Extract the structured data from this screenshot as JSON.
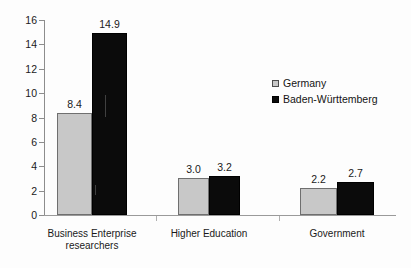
{
  "chart_data": {
    "type": "bar",
    "title": "",
    "subtitle": "",
    "xlabel": "",
    "ylabel": "",
    "categories": [
      "Business Enterprise\nresearchers",
      "Higher Education",
      "Government"
    ],
    "series": [
      {
        "name": "Germany",
        "color": "#c8c8c8",
        "values": [
          8.4,
          3.0,
          2.2
        ],
        "value_labels": [
          "8.4",
          "3.0",
          "2.2"
        ]
      },
      {
        "name": "Baden-Württemberg",
        "color": "#0b0b0b",
        "values": [
          14.9,
          3.2,
          2.7
        ],
        "value_labels": [
          "14.9",
          "3.2",
          "2.7"
        ]
      }
    ],
    "ylim": [
      0,
      16
    ],
    "ytick_step": 2,
    "ytick_labels": [
      "0",
      "2",
      "4",
      "6",
      "8",
      "10",
      "12",
      "14",
      "16"
    ],
    "ytick_values": [
      0,
      2,
      4,
      6,
      8,
      10,
      12,
      14,
      16
    ],
    "grid": false,
    "legend_position": "upper-right",
    "axis_color": "#8d8d8d",
    "text_color": "#1a1a1a"
  },
  "legend": {
    "items": [
      {
        "label": "Germany",
        "swatch": "germany-swatch"
      },
      {
        "label": "Baden-Württemberg",
        "swatch": "baden-wuerttemberg-swatch"
      }
    ]
  }
}
